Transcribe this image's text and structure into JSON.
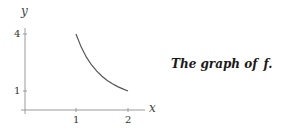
{
  "caption": {
    "text": "The graph of",
    "function_name": "f",
    "period": "."
  },
  "chart_data": {
    "type": "line",
    "title": "",
    "xlabel": "x",
    "ylabel": "y",
    "xlim": [
      0,
      2.2
    ],
    "ylim": [
      0,
      4.5
    ],
    "x_ticks": [
      1,
      2
    ],
    "x_tick_labels": [
      "1",
      "2"
    ],
    "y_ticks": [
      1,
      4
    ],
    "y_tick_labels": [
      "1",
      "4"
    ],
    "grid": false,
    "legend": null,
    "series": [
      {
        "name": "f",
        "x": [
          1.0,
          1.1,
          1.2,
          1.3,
          1.4,
          1.5,
          1.6,
          1.7,
          1.8,
          1.9,
          2.0
        ],
        "y": [
          4.0,
          3.31,
          2.78,
          2.37,
          2.04,
          1.78,
          1.56,
          1.38,
          1.23,
          1.11,
          1.0
        ]
      }
    ],
    "colors": {
      "curve": "#555555",
      "axis": "#999999"
    }
  }
}
